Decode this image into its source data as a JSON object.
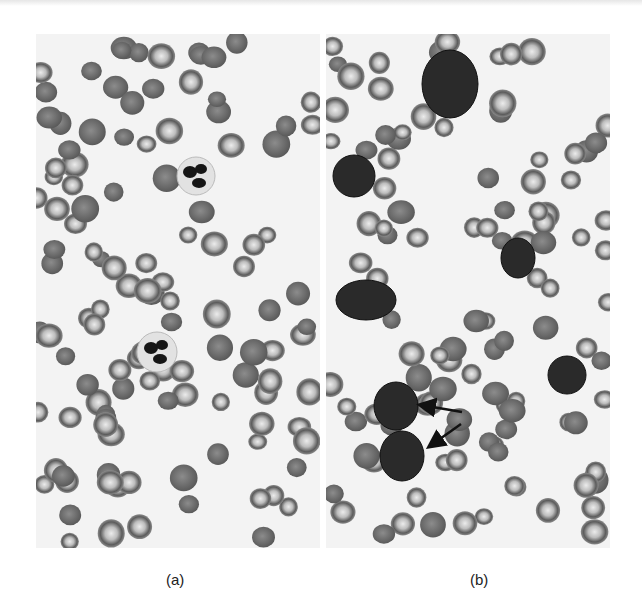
{
  "figure": {
    "panels": [
      {
        "id": "a",
        "label": "(a)",
        "description": "Blood smear micrograph with red blood cells and two segmented neutrophils",
        "neutrophils": [
          {
            "x": 160,
            "y": 142,
            "r": 19
          },
          {
            "x": 121,
            "y": 318,
            "r": 20
          }
        ]
      },
      {
        "id": "b",
        "label": "(b)",
        "description": "Blood smear micrograph with red blood cells and several large dark-staining blast cells; two indicated by arrows",
        "blasts": [
          {
            "x": 124,
            "y": 50,
            "rx": 28,
            "ry": 34
          },
          {
            "x": 28,
            "y": 142,
            "rx": 21,
            "ry": 21
          },
          {
            "x": 40,
            "y": 266,
            "rx": 30,
            "ry": 20
          },
          {
            "x": 192,
            "y": 224,
            "rx": 17,
            "ry": 20
          },
          {
            "x": 241,
            "y": 341,
            "rx": 19,
            "ry": 19
          },
          {
            "x": 70,
            "y": 372,
            "rx": 22,
            "ry": 24
          },
          {
            "x": 76,
            "y": 422,
            "rx": 22,
            "ry": 25
          }
        ],
        "arrows": [
          {
            "x1": 136,
            "y1": 378,
            "x2": 95,
            "y2": 371
          },
          {
            "x1": 135,
            "y1": 390,
            "x2": 104,
            "y2": 412
          }
        ]
      }
    ],
    "colors": {
      "background": "#f3f3f3",
      "rbc_rim": "#5a5a5a",
      "rbc_center": "#e8e8e8",
      "nucleus": "#151515",
      "blast": "#2a2a2a"
    }
  }
}
